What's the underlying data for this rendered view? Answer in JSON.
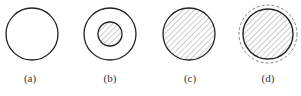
{
  "figure": {
    "panels": [
      {
        "label": "(a)",
        "cx": 32,
        "cy": 34,
        "outer_r": 26,
        "outer_style": "solid",
        "fill": "none",
        "inner": null
      },
      {
        "label": "(b)",
        "cx": 110,
        "cy": 34,
        "outer_r": 26,
        "outer_style": "solid",
        "fill": "none",
        "inner": {
          "r": 12,
          "fill": "hatched"
        }
      },
      {
        "label": "(c)",
        "cx": 189,
        "cy": 34,
        "outer_r": 26,
        "outer_style": "solid",
        "fill": "hatched",
        "inner": null
      },
      {
        "label": "(d)",
        "cx": 268,
        "cy": 34,
        "outer_r": 25,
        "outer_style": "solid",
        "fill": "hatched",
        "inner": null,
        "dashed_ring_r": 29
      }
    ],
    "colors": {
      "stroke": "#222222",
      "hatch": "#9a9a9a",
      "dashed": "#777777",
      "text": "#333333"
    }
  }
}
